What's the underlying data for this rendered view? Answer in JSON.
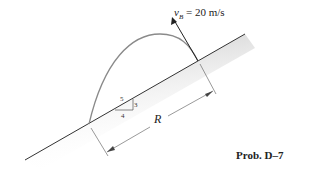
{
  "figure": {
    "velocity_label": {
      "symbol": "v",
      "subscript": "B",
      "equals": " = ",
      "value": "20 m/s"
    },
    "range_label": "R",
    "slope": {
      "hypotenuse": "5",
      "rise": "3",
      "run": "4"
    },
    "caption": "Prob. D–7",
    "colors": {
      "ground_shade": "#d4d4d4",
      "line": "#333333",
      "trajectory": "#8a8a8a"
    }
  }
}
